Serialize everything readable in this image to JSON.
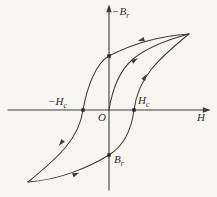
{
  "figure": {
    "kind": "magnetic-hysteresis-loop",
    "colors": {
      "background": "#f7f6f2",
      "line": "#3e3e3a",
      "text": "#2f2f2b",
      "marker": "#262622"
    },
    "labels": {
      "y_axis": {
        "main": "−B",
        "sub": "r"
      },
      "x_axis": {
        "main": "H"
      },
      "origin": {
        "main": "O"
      },
      "coercivity_neg": {
        "main": "−H",
        "sub": "c"
      },
      "coercivity_pos": {
        "main": "H",
        "sub": "c"
      },
      "remanence_neg": {
        "main": "B",
        "sub": "r"
      }
    }
  }
}
